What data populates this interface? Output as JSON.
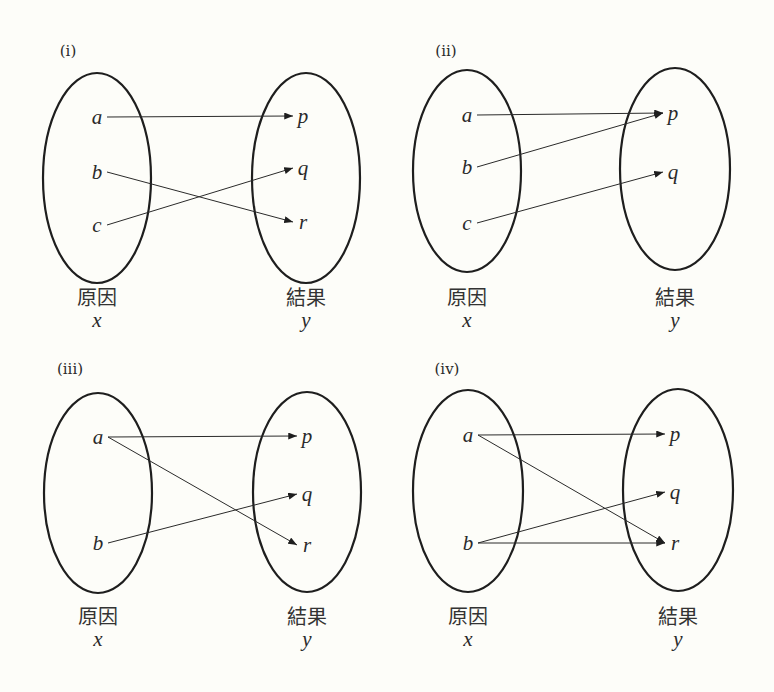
{
  "colors": {
    "background": "#fdfdf9",
    "ink": "#1e1e1e"
  },
  "captions": {
    "cause": "原因",
    "effect": "結果",
    "cause_var": "x",
    "effect_var": "y"
  },
  "panels": [
    {
      "label": "(i)",
      "label_pos": [
        68,
        56
      ],
      "left_set": {
        "cx": 97,
        "cy": 178,
        "rx": 54,
        "ry": 105
      },
      "right_set": {
        "cx": 306,
        "cy": 178,
        "rx": 54,
        "ry": 105
      },
      "causes": [
        {
          "name": "a",
          "x": 97,
          "y": 117
        },
        {
          "name": "b",
          "x": 97,
          "y": 172
        },
        {
          "name": "c",
          "x": 97,
          "y": 225
        }
      ],
      "effects": [
        {
          "name": "p",
          "x": 303,
          "y": 116
        },
        {
          "name": "q",
          "x": 303,
          "y": 168
        },
        {
          "name": "r",
          "x": 303,
          "y": 222
        }
      ],
      "mappings": [
        [
          "a",
          "p"
        ],
        [
          "b",
          "r"
        ],
        [
          "c",
          "q"
        ]
      ],
      "caption_y": 298
    },
    {
      "label": "(ii)",
      "label_pos": [
        446,
        56
      ],
      "left_set": {
        "cx": 467,
        "cy": 171,
        "rx": 54,
        "ry": 101
      },
      "right_set": {
        "cx": 675,
        "cy": 169,
        "rx": 55,
        "ry": 101
      },
      "causes": [
        {
          "name": "a",
          "x": 467,
          "y": 115
        },
        {
          "name": "b",
          "x": 467,
          "y": 167
        },
        {
          "name": "c",
          "x": 467,
          "y": 223
        }
      ],
      "effects": [
        {
          "name": "p",
          "x": 673,
          "y": 113
        },
        {
          "name": "q",
          "x": 673,
          "y": 172
        }
      ],
      "mappings": [
        [
          "a",
          "p"
        ],
        [
          "b",
          "p"
        ],
        [
          "c",
          "q"
        ]
      ],
      "caption_y": 298
    },
    {
      "label": "(iii)",
      "label_pos": [
        70,
        374
      ],
      "left_set": {
        "cx": 98,
        "cy": 493,
        "rx": 54,
        "ry": 100
      },
      "right_set": {
        "cx": 307,
        "cy": 492,
        "rx": 54,
        "ry": 100
      },
      "causes": [
        {
          "name": "a",
          "x": 98,
          "y": 437
        },
        {
          "name": "b",
          "x": 98,
          "y": 543
        }
      ],
      "effects": [
        {
          "name": "p",
          "x": 307,
          "y": 436
        },
        {
          "name": "q",
          "x": 307,
          "y": 494
        },
        {
          "name": "r",
          "x": 307,
          "y": 545
        }
      ],
      "mappings": [
        [
          "a",
          "p"
        ],
        [
          "a",
          "r"
        ],
        [
          "b",
          "q"
        ]
      ],
      "caption_y": 617
    },
    {
      "label": "(iv)",
      "label_pos": [
        447,
        374
      ],
      "left_set": {
        "cx": 468,
        "cy": 491,
        "rx": 55,
        "ry": 101
      },
      "right_set": {
        "cx": 678,
        "cy": 490,
        "rx": 55,
        "ry": 101
      },
      "causes": [
        {
          "name": "a",
          "x": 468,
          "y": 435
        },
        {
          "name": "b",
          "x": 468,
          "y": 543
        }
      ],
      "effects": [
        {
          "name": "p",
          "x": 675,
          "y": 434
        },
        {
          "name": "q",
          "x": 675,
          "y": 492
        },
        {
          "name": "r",
          "x": 675,
          "y": 543
        }
      ],
      "mappings": [
        [
          "a",
          "p"
        ],
        [
          "a",
          "r"
        ],
        [
          "b",
          "q"
        ],
        [
          "b",
          "r"
        ]
      ],
      "caption_y": 617
    }
  ]
}
